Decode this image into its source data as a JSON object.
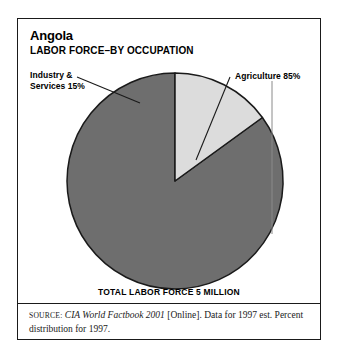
{
  "figure": {
    "title": "Angola",
    "subtitle": "LABOR FORCE–BY OCCUPATION",
    "total_caption": "TOTAL LABOR FORCE 5 MILLION"
  },
  "labels": {
    "industry": "Industry &\nServices 15%",
    "agriculture": "Agriculture 85%"
  },
  "source": {
    "label": "Source:",
    "publication": "CIA World Factbook 2001",
    "detail": " [Online]. Data for 1997 est. Percent distribution for 1997."
  },
  "colors": {
    "agriculture": "#6e6e6e",
    "industry": "#dcdcdc",
    "outline": "#1a1a1a",
    "frame": "#1a1a1a",
    "text": "#000000"
  },
  "chart_data": {
    "type": "pie",
    "subtitle": "LABOR FORCE–BY OCCUPATION",
    "categories": [
      "Agriculture",
      "Industry & Services"
    ],
    "values": [
      85,
      15
    ],
    "unit": "percent",
    "total_label": "TOTAL LABOR FORCE 5 MILLION",
    "total_value": 5,
    "total_unit": "million workers",
    "start_angle_deg": 0,
    "direction": "counterclockwise",
    "legend": "none",
    "labels_position": "outside-with-leader-lines",
    "annotations": [
      "Industry & Services 15%",
      "Agriculture 85%"
    ],
    "grid": false
  }
}
